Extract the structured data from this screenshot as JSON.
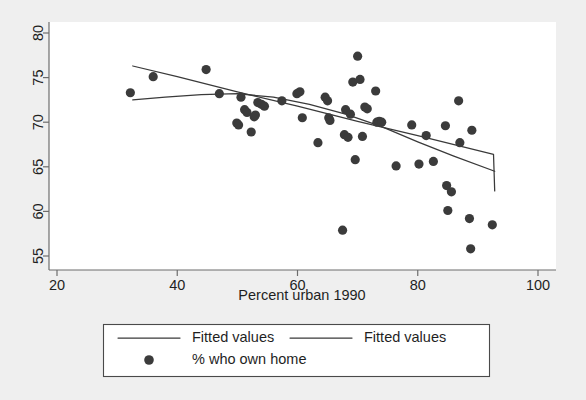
{
  "chart_data": {
    "type": "scatter",
    "title": "",
    "xlabel": "Percent urban 1990",
    "ylabel": "",
    "xlim": [
      20,
      100
    ],
    "ylim": [
      54,
      80.8
    ],
    "xticks": [
      20,
      40,
      60,
      80,
      100
    ],
    "yticks": [
      55,
      60,
      65,
      70,
      75,
      80
    ],
    "xtick_labels": [
      "20",
      "40",
      "60",
      "80",
      "100"
    ],
    "ytick_labels": [
      "55",
      "60",
      "65",
      "70",
      "75",
      "80"
    ],
    "grid": false,
    "legend_position": "below-axis",
    "marker_color": "#3b3b3b",
    "line_color": "#3a3a3a",
    "panel_color": "#ffffff",
    "background_color": "#efefef",
    "series": [
      {
        "name": "% who own home",
        "type": "scatter",
        "points": [
          [
            32.2,
            73.3
          ],
          [
            36.0,
            75.1
          ],
          [
            44.8,
            75.9
          ],
          [
            47.0,
            73.2
          ],
          [
            49.9,
            69.9
          ],
          [
            50.2,
            69.7
          ],
          [
            50.6,
            72.8
          ],
          [
            51.2,
            71.4
          ],
          [
            51.6,
            71.1
          ],
          [
            52.3,
            68.9
          ],
          [
            52.8,
            70.6
          ],
          [
            53.0,
            70.8
          ],
          [
            53.4,
            72.2
          ],
          [
            54.0,
            72.0
          ],
          [
            54.5,
            71.8
          ],
          [
            57.4,
            72.4
          ],
          [
            59.9,
            73.2
          ],
          [
            60.4,
            73.4
          ],
          [
            60.8,
            70.5
          ],
          [
            63.4,
            67.7
          ],
          [
            64.6,
            72.8
          ],
          [
            65.0,
            72.4
          ],
          [
            65.2,
            70.5
          ],
          [
            65.4,
            70.2
          ],
          [
            67.5,
            57.9
          ],
          [
            67.8,
            68.6
          ],
          [
            68.0,
            71.4
          ],
          [
            68.4,
            68.3
          ],
          [
            68.8,
            70.9
          ],
          [
            69.2,
            74.5
          ],
          [
            69.6,
            65.8
          ],
          [
            70.0,
            77.4
          ],
          [
            70.4,
            74.8
          ],
          [
            70.8,
            68.4
          ],
          [
            71.2,
            71.7
          ],
          [
            71.6,
            71.5
          ],
          [
            73.0,
            73.5
          ],
          [
            73.2,
            70.0
          ],
          [
            73.6,
            70.1
          ],
          [
            74.0,
            70.0
          ],
          [
            76.4,
            65.1
          ],
          [
            79.0,
            69.7
          ],
          [
            80.2,
            65.3
          ],
          [
            81.4,
            68.5
          ],
          [
            82.6,
            65.6
          ],
          [
            84.6,
            69.6
          ],
          [
            84.8,
            62.9
          ],
          [
            85.0,
            60.1
          ],
          [
            85.6,
            62.2
          ],
          [
            86.8,
            72.4
          ],
          [
            87.0,
            67.7
          ],
          [
            88.6,
            59.2
          ],
          [
            88.8,
            55.8
          ],
          [
            89.0,
            69.1
          ],
          [
            92.4,
            58.5
          ]
        ]
      },
      {
        "name": "Fitted values",
        "type": "line",
        "points": [
          [
            32.6,
            76.3
          ],
          [
            40.0,
            75.1
          ],
          [
            50.0,
            73.4
          ],
          [
            60.0,
            71.8
          ],
          [
            70.0,
            70.1
          ],
          [
            80.0,
            68.5
          ],
          [
            92.6,
            66.4
          ],
          [
            92.8,
            62.3
          ]
        ]
      },
      {
        "name": "Fitted values",
        "type": "line",
        "points": [
          [
            32.6,
            72.5
          ],
          [
            38.0,
            72.8
          ],
          [
            44.0,
            73.1
          ],
          [
            50.0,
            73.2
          ],
          [
            56.0,
            72.8
          ],
          [
            62.0,
            72.0
          ],
          [
            68.0,
            70.9
          ],
          [
            74.0,
            69.5
          ],
          [
            80.0,
            67.8
          ],
          [
            86.0,
            66.2
          ],
          [
            92.8,
            64.5
          ]
        ]
      }
    ],
    "legend_entries": [
      {
        "label": "Fitted values",
        "kind": "line"
      },
      {
        "label": "Fitted values",
        "kind": "line"
      },
      {
        "label": "% who own home",
        "kind": "marker"
      }
    ]
  }
}
